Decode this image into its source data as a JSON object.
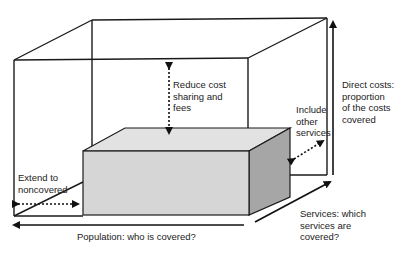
{
  "diagram": {
    "labels": {
      "reduce_cost": [
        "Reduce cost",
        "sharing and",
        "fees"
      ],
      "include_other": [
        "Include",
        "other",
        "services"
      ],
      "direct_costs": [
        "Direct costs:",
        "proportion",
        "of the costs",
        "covered"
      ],
      "extend": [
        "Extend to",
        "noncovered"
      ],
      "population": "Population: who is covered?",
      "services": [
        "Services: which",
        "services are",
        "covered?"
      ]
    },
    "colors": {
      "line": "#1a1a1a",
      "box_front": "#d6d6d6",
      "box_top": "#e2e2e2",
      "box_side": "#a6a6a6"
    }
  }
}
